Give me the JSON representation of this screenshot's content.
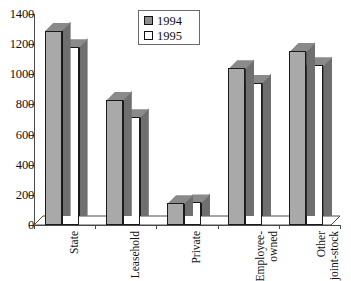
{
  "chart_data": {
    "type": "bar",
    "title": "",
    "subtitle": "",
    "xlabel": "",
    "ylabel": "",
    "ylim": [
      0,
      1400
    ],
    "ytick_step": 200,
    "yticks": [
      0,
      200,
      400,
      600,
      800,
      1000,
      1200,
      1400
    ],
    "ytick_labels": [
      "0",
      "200",
      "400",
      "600",
      "800",
      "1000",
      "1200",
      "1400"
    ],
    "grid": false,
    "three_d": true,
    "legend_position": "upper-center",
    "categories": [
      "State",
      "Leasehold",
      "Private",
      "Employee-owned",
      "Other joint-stock"
    ],
    "category_label_lines": [
      [
        "State"
      ],
      [
        "Leasehold"
      ],
      [
        "Private"
      ],
      [
        "Employee-",
        "owned"
      ],
      [
        "Other",
        "joint-stock"
      ]
    ],
    "series": [
      {
        "name": "1994",
        "color": "#a9a9a9",
        "values": [
          1290,
          830,
          145,
          1040,
          1155
        ]
      },
      {
        "name": "1995",
        "color": "#ffffff",
        "values": [
          1180,
          715,
          150,
          945,
          1060
        ]
      }
    ]
  },
  "legend": {
    "entries": [
      {
        "label": "1994",
        "swatch": "filled-gray-square"
      },
      {
        "label": "1995",
        "swatch": "empty-white-square"
      }
    ]
  },
  "colors": {
    "series_1994": "#a9a9a9",
    "series_1995": "#ffffff",
    "bar_outline": "#1a1a1a",
    "bar_top_shade": "#8a8a8a",
    "bar_side_shade": "#6f6f6f",
    "axis": "#4a4a4a",
    "background": "#ffffff",
    "text": "#111111"
  }
}
